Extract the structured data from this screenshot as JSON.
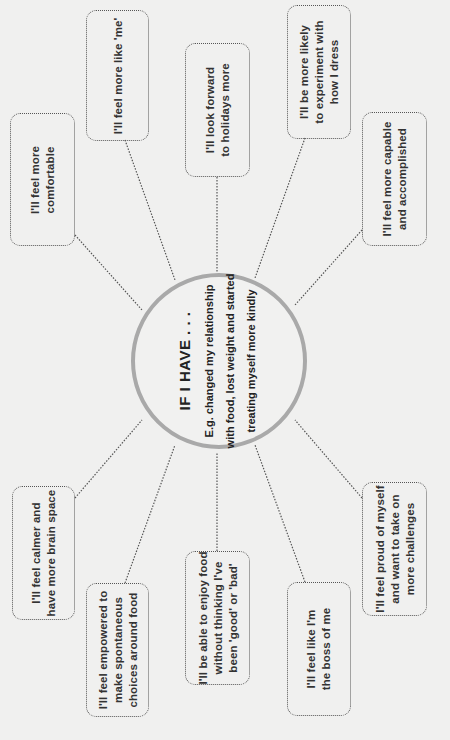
{
  "diagram": {
    "orientation": "rotated -90deg",
    "center": {
      "title": "IF I HAVE . . .",
      "subtitle": "E.g. changed my relationship\nwith food, lost weight and started\ntreating myself more kindly"
    },
    "outcomes": [
      {
        "id": "comfortable",
        "text": "I'll feel more\ncomfortable"
      },
      {
        "id": "like-me",
        "text": "I'll feel more like 'me'"
      },
      {
        "id": "holidays",
        "text": "I'll look forward\nto holidays more"
      },
      {
        "id": "dress",
        "text": "I'll be more likely\nto experiment with\nhow I dress"
      },
      {
        "id": "capable",
        "text": "I'll feel more capable\nand accomplished"
      },
      {
        "id": "calmer",
        "text": "I'll feel calmer and\nhave more brain space"
      },
      {
        "id": "empowered",
        "text": "I'll feel empowered to\nmake spontaneous\nchoices around food"
      },
      {
        "id": "enjoy-food",
        "text": "I'll be able to enjoy food\nwithout thinking I've\nbeen 'good' or 'bad'"
      },
      {
        "id": "boss",
        "text": "I'll feel like I'm\nthe boss of me"
      },
      {
        "id": "proud",
        "text": "I'll feel proud of myself\nand want to take on\nmore challenges"
      }
    ],
    "colors": {
      "background": "#f0f0ef",
      "hub_stroke": "#a9a9a9",
      "connector": "#555555",
      "text": "#333333"
    }
  }
}
